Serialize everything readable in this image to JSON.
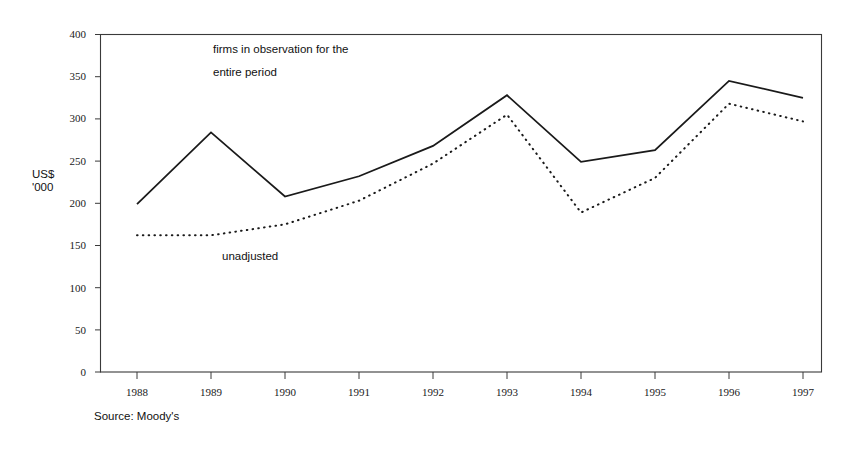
{
  "chart_data": {
    "type": "line",
    "title": "",
    "xlabel": "",
    "ylabel": "US$\n'000",
    "categories": [
      "1988",
      "1989",
      "1990",
      "1991",
      "1992",
      "1993",
      "1994",
      "1995",
      "1996",
      "1997"
    ],
    "ylim": [
      0,
      400
    ],
    "yticks": [
      0,
      50,
      100,
      150,
      200,
      250,
      300,
      350,
      400
    ],
    "grid": false,
    "legend_position": "in-plot annotations",
    "series": [
      {
        "name": "firms in observation for the entire period",
        "style": "solid",
        "color": "#1a1a1a",
        "values": [
          199,
          284,
          208,
          232,
          268,
          328,
          249,
          263,
          345,
          325
        ]
      },
      {
        "name": "unadjusted",
        "style": "dotted",
        "color": "#1a1a1a",
        "values": [
          162,
          162,
          175,
          203,
          247,
          305,
          189,
          230,
          318,
          297
        ]
      }
    ],
    "annotations": [
      {
        "id": "adjusted",
        "text": "firms in observation for the\nentire period"
      },
      {
        "id": "unadjusted",
        "text": "unadjusted"
      }
    ],
    "source": "Source: Moody's"
  }
}
